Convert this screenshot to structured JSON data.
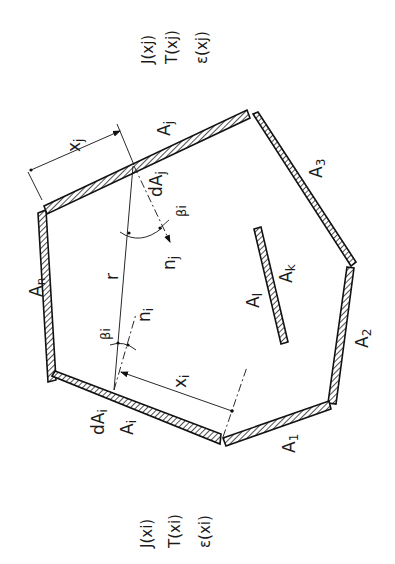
{
  "labels": {
    "surface_n": "A",
    "surface_n_sub": "n",
    "surface_j": "A",
    "surface_j_sub": "j",
    "surface_3": "A",
    "surface_3_sub": "3",
    "surface_2": "A",
    "surface_2_sub": "2",
    "surface_1": "A",
    "surface_1_sub": "1",
    "surface_i": "A",
    "surface_i_sub": "i",
    "surface_k": "A",
    "surface_k_sub": "k",
    "surface_l": "A",
    "surface_l_sub": "l",
    "element_j": "dA",
    "element_j_sub": "j",
    "element_i": "dA",
    "element_i_sub": "i",
    "coord_j": "x",
    "coord_j_sub": "j",
    "coord_i": "x",
    "coord_i_sub": "i",
    "distance": "r",
    "angle_j": "βi",
    "angle_i": "βi",
    "normal_j": "n",
    "normal_j_sub": "j",
    "normal_i": "n",
    "normal_i_sub": "i"
  },
  "properties_j": [
    "J(xj)",
    "T(xj)",
    "ε(xj)"
  ],
  "properties_i": [
    "J(xi)",
    "T(xi)",
    "ε(xi)"
  ]
}
